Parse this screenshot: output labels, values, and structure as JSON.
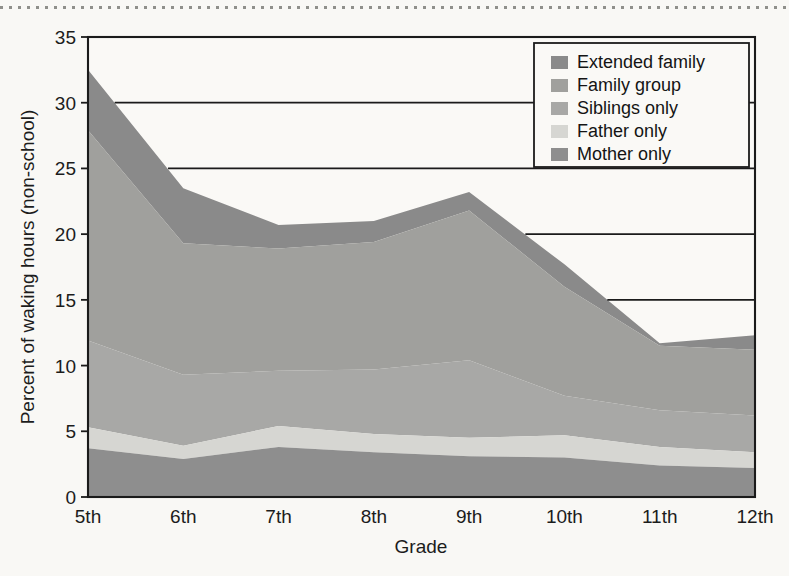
{
  "figure": {
    "background_color": "#f9f8f5",
    "plot_background_color": "#faf9f6"
  },
  "chart_data": {
    "type": "area",
    "stacked": true,
    "title": "",
    "xlabel": "Grade",
    "ylabel": "Percent of waking hours (non-school)",
    "categories": [
      "5th",
      "6th",
      "7th",
      "8th",
      "9th",
      "10th",
      "11th",
      "12th"
    ],
    "x": [
      "5th",
      "6th",
      "7th",
      "8th",
      "9th",
      "10th",
      "11th",
      "12th"
    ],
    "ylim": [
      0,
      35
    ],
    "yticks": [
      0,
      5,
      10,
      15,
      20,
      25,
      30,
      35
    ],
    "ytick_labels": [
      "0",
      "5",
      "10",
      "15",
      "20",
      "25",
      "30",
      "35"
    ],
    "xlim": [
      "5th",
      "12th"
    ],
    "grid": "horizontal-partial",
    "legend_position": "top-right",
    "stack_order_bottom_to_top": [
      "Mother only",
      "Father only",
      "Siblings only",
      "Family group",
      "Extended family"
    ],
    "series": [
      {
        "name": "Mother only",
        "color": "#8e8e8e",
        "values": [
          3.7,
          2.9,
          3.8,
          3.4,
          3.1,
          3.0,
          2.4,
          2.2
        ]
      },
      {
        "name": "Father only",
        "color": "#d6d6d2",
        "values": [
          1.6,
          1.0,
          1.6,
          1.4,
          1.4,
          1.7,
          1.4,
          1.2
        ]
      },
      {
        "name": "Siblings only",
        "color": "#a8a8a6",
        "values": [
          6.6,
          5.4,
          4.2,
          4.9,
          5.9,
          3.0,
          2.8,
          2.8
        ]
      },
      {
        "name": "Family group",
        "color": "#a0a09d",
        "values": [
          16.0,
          10.0,
          9.3,
          9.7,
          11.4,
          8.3,
          4.9,
          5.0
        ]
      },
      {
        "name": "Extended family",
        "color": "#8a8a8a",
        "values": [
          4.6,
          4.2,
          1.8,
          1.6,
          1.4,
          1.7,
          0.2,
          1.1
        ]
      }
    ],
    "cumulative_tops": {
      "Mother only": [
        3.7,
        2.9,
        3.8,
        3.4,
        3.1,
        3.0,
        2.4,
        2.2
      ],
      "Father only": [
        5.3,
        3.9,
        5.4,
        4.8,
        4.5,
        4.7,
        3.8,
        3.4
      ],
      "Siblings only": [
        11.9,
        9.3,
        9.6,
        9.7,
        10.4,
        7.7,
        6.6,
        6.2
      ],
      "Family group": [
        27.9,
        19.3,
        18.9,
        19.4,
        21.8,
        16.0,
        11.5,
        11.2
      ],
      "Extended family": [
        32.5,
        23.5,
        20.7,
        21.0,
        23.2,
        17.7,
        11.7,
        12.3
      ]
    },
    "totals": [
      32.5,
      23.5,
      20.7,
      21.0,
      23.2,
      17.7,
      11.7,
      12.3
    ]
  },
  "legend": {
    "items": [
      {
        "label": "Extended family",
        "color": "#8a8a8a"
      },
      {
        "label": "Family group",
        "color": "#a0a09d"
      },
      {
        "label": "Siblings only",
        "color": "#a8a8a6"
      },
      {
        "label": "Father only",
        "color": "#d6d6d2"
      },
      {
        "label": "Mother only",
        "color": "#8e8e8e"
      }
    ]
  },
  "axes": {
    "y_title": "Percent of waking hours (non-school)",
    "x_title": "Grade",
    "y_ticks": [
      "35",
      "30",
      "25",
      "20",
      "15",
      "10",
      "5",
      "0"
    ],
    "x_ticks": [
      "5th",
      "6th",
      "7th",
      "8th",
      "9th",
      "10th",
      "11th",
      "12th"
    ]
  }
}
